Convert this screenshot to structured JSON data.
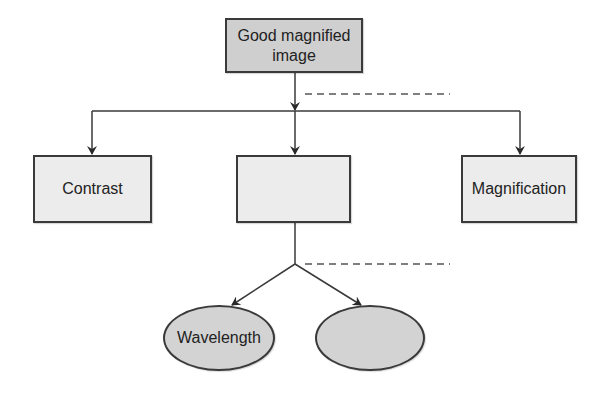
{
  "diagram": {
    "root": {
      "label": "Good magnified\nimage",
      "line1": "Good magnified",
      "line2": "image",
      "fill": "#cfcfcf"
    },
    "level1": [
      {
        "label": "Contrast",
        "fill": "#ececec"
      },
      {
        "label": "",
        "fill": "#ececec"
      },
      {
        "label": "Magnification",
        "fill": "#ececec"
      }
    ],
    "level2": [
      {
        "label": "Wavelength",
        "shape": "ellipse",
        "fill": "#d3d3d3"
      },
      {
        "label": "",
        "shape": "ellipse",
        "fill": "#d3d3d3"
      }
    ],
    "annotations": [
      {
        "type": "dashed-line",
        "label": ""
      },
      {
        "type": "dashed-line",
        "label": ""
      }
    ],
    "colors": {
      "stroke": "#3a3a3a",
      "dashed": "#555555",
      "background": "#ffffff"
    }
  }
}
